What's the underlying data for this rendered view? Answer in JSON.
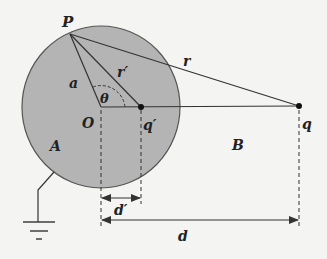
{
  "figure": {
    "labels": {
      "P": "P",
      "a": "a",
      "r_prime": "r′",
      "r": "r",
      "theta": "θ",
      "O": "O",
      "q_prime": "q′",
      "q": "q",
      "A": "A",
      "B": "B",
      "d_prime": "d′",
      "d": "d"
    },
    "colors": {
      "sphere_fill": "#b4b4b4",
      "line": "#333333",
      "background": "#f4f4f2"
    }
  }
}
